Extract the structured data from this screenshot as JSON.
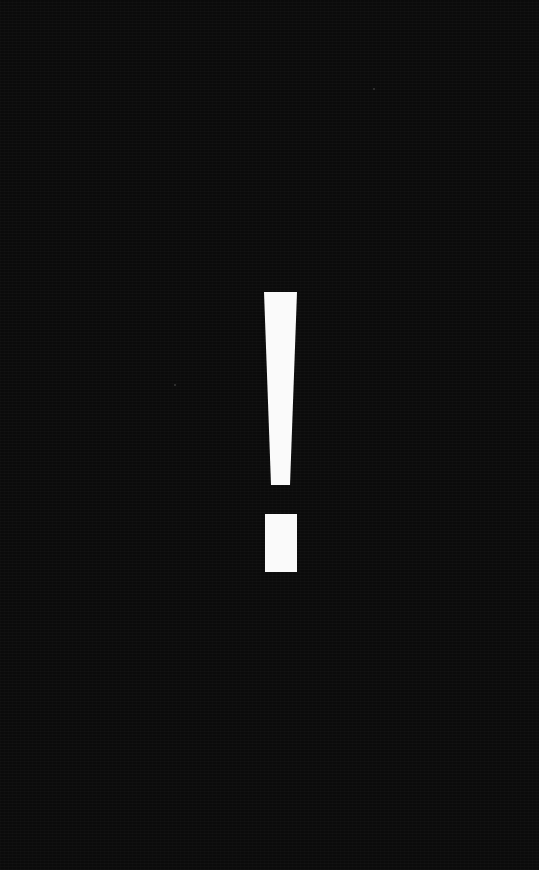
{
  "screen": {
    "background_color": "#0b0b0b",
    "foreground_color": "#fafafa"
  },
  "symbol": {
    "glyph": "!",
    "icon": "exclamation-icon",
    "bar": {
      "top_left": [
        264,
        292
      ],
      "top_right": [
        297,
        292
      ],
      "bottom_right": [
        290,
        485
      ],
      "bottom_left": [
        271,
        485
      ]
    },
    "dot": {
      "x": 265,
      "y": 514,
      "width": 32,
      "height": 58
    }
  }
}
